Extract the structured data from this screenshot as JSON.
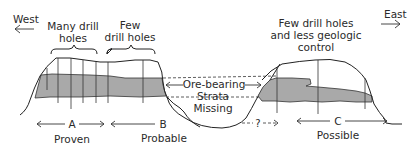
{
  "diagram": {
    "type": "geologic cross-section of ore reserve classification",
    "directions": {
      "west": "West",
      "east": "East"
    },
    "annotations": {
      "many_holes_line1": "Many drill",
      "many_holes_line2": "holes",
      "few_holes_line1": "Few",
      "few_holes_line2": "drill holes",
      "less_control_line1": "Few drill holes",
      "less_control_line2": "and less geologic",
      "less_control_line3": "control",
      "ore_bearing": "Ore-bearing",
      "strata": "Strata",
      "missing": "Missing",
      "question": "?"
    },
    "zones": [
      {
        "letter": "A",
        "label": "Proven"
      },
      {
        "letter": "B",
        "label": "Probable"
      },
      {
        "letter": "C",
        "label": "Possible"
      }
    ],
    "colors": {
      "ore_fill": "#a9a9a9",
      "outline": "#222222",
      "background": "#ffffff"
    }
  }
}
